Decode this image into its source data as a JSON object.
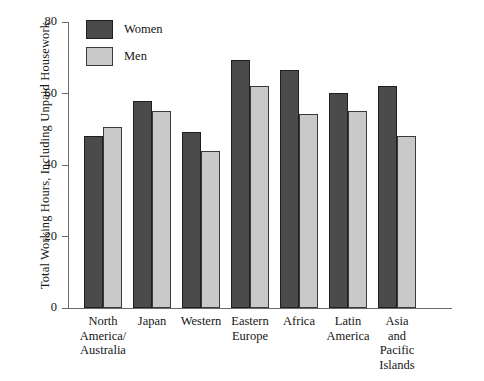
{
  "chart_data": {
    "type": "bar",
    "title": "",
    "xlabel": "",
    "ylabel": "Total Working Hours, Including Unpaid Housework",
    "ylim": [
      0,
      80
    ],
    "yticks": [
      0,
      20,
      40,
      60,
      80
    ],
    "grid": false,
    "legend_position": "top-left",
    "categories": [
      "North America/ Australia",
      "Japan",
      "Western",
      "Eastern Europe",
      "Africa",
      "Latin America",
      "Asia and Pacific Islands"
    ],
    "category_lines": [
      [
        "North",
        "America/",
        "Australia"
      ],
      [
        "Japan"
      ],
      [
        "Western"
      ],
      [
        "Eastern",
        "Europe"
      ],
      [
        "Africa"
      ],
      [
        "Latin",
        "America"
      ],
      [
        "Asia",
        "and",
        "Pacific",
        "Islands"
      ]
    ],
    "series": [
      {
        "name": "Women",
        "color": "#4b4b4b",
        "values": [
          48.0,
          57.8,
          49.2,
          69.5,
          66.5,
          60.1,
          62.2
        ]
      },
      {
        "name": "Men",
        "color": "#c9c9c9",
        "values": [
          50.5,
          55.2,
          43.8,
          62.2,
          54.2,
          55.2,
          48.0
        ]
      }
    ]
  },
  "axis": {
    "y_tick_labels": [
      "0",
      "20",
      "40",
      "60",
      "80"
    ]
  },
  "legend": {
    "items": [
      {
        "label": "Women",
        "swatch": "women"
      },
      {
        "label": "Men",
        "swatch": "men"
      }
    ]
  }
}
